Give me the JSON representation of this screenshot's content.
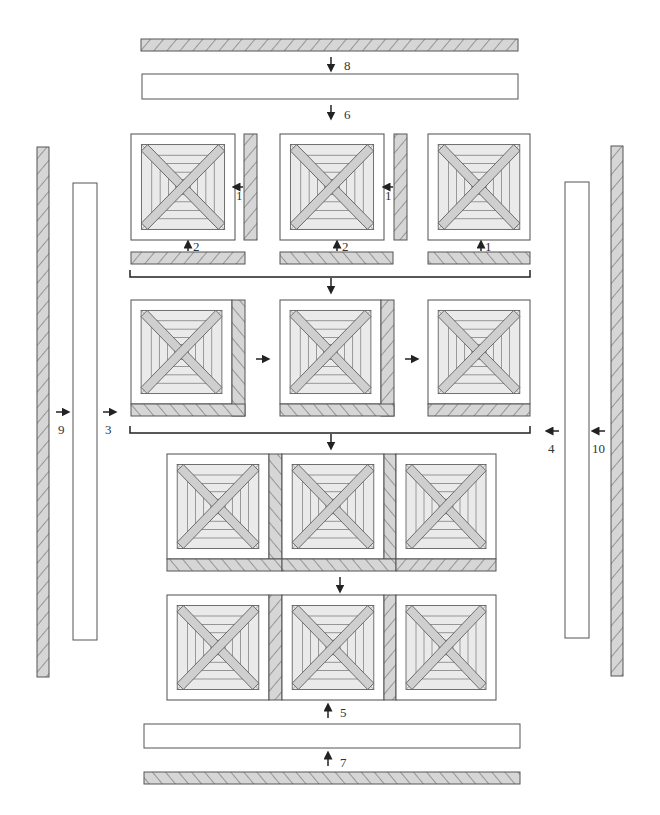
{
  "diagram": {
    "type": "quilt-assembly",
    "colors": {
      "outline": "#555555",
      "fill_light": "#e8e8e8",
      "fill_band": "#cfcfcf",
      "hatch_fill": "#d6d6d6",
      "white": "#ffffff"
    },
    "step_labels": {
      "top_hatched": "8",
      "top_white": "6",
      "row1_b1_side": "1",
      "row1_b1_bottom": "2",
      "row1_b2_side": "1",
      "row1_b2_bottom": "2",
      "row1_b3_bottom": "1",
      "left_hatched": "9",
      "left_white": "3",
      "right_white": "4",
      "right_hatched": "10",
      "bottom_white": "5",
      "bottom_hatched": "7"
    },
    "rows": [
      {
        "name": "row-1",
        "blocks": 3,
        "stage": "blocks with separate sashing strips"
      },
      {
        "name": "row-2",
        "blocks": 3,
        "stage": "blocks with sashing attached, joined"
      },
      {
        "name": "row-3",
        "blocks": 3,
        "stage": "assembled row"
      },
      {
        "name": "row-4",
        "blocks": 3,
        "stage": "assembled row"
      }
    ]
  }
}
